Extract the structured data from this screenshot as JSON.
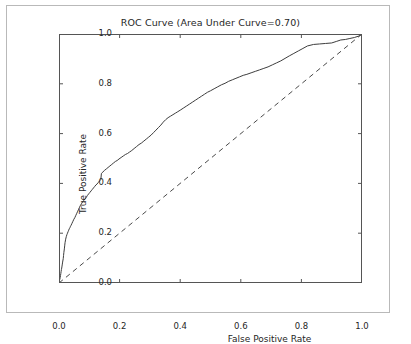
{
  "figure": {
    "background_color": "#ffffff",
    "frame_color": "#b9b9b9",
    "axis_color": "#555555",
    "curve_color": "#3d3d3d",
    "chance_line_color": "#4a4a4a",
    "text_color": "#262626"
  },
  "chart_data": {
    "type": "line",
    "title": "ROC Curve (Area Under Curve=0.70)",
    "xlabel": "False Positive Rate",
    "ylabel": "True Positive Rate",
    "xlim": [
      0.0,
      1.0
    ],
    "ylim": [
      0.0,
      1.0
    ],
    "grid": false,
    "legend": "none",
    "auc": 0.7,
    "xticks": [
      "0.0",
      "0.2",
      "0.4",
      "0.6",
      "0.8",
      "1.0"
    ],
    "xtick_values": [
      0.0,
      0.2,
      0.4,
      0.6,
      0.8,
      1.0
    ],
    "yticks": [
      "0.0",
      "0.2",
      "0.4",
      "0.6",
      "0.8",
      "1.0"
    ],
    "ytick_values": [
      0.0,
      0.2,
      0.4,
      0.6,
      0.8,
      1.0
    ],
    "series": [
      {
        "name": "ROC curve",
        "style": "solid",
        "x": [
          0.0,
          0.002,
          0.004,
          0.005,
          0.006,
          0.007,
          0.008,
          0.009,
          0.01,
          0.011,
          0.012,
          0.014,
          0.015,
          0.016,
          0.018,
          0.019,
          0.02,
          0.022,
          0.024,
          0.026,
          0.028,
          0.03,
          0.032,
          0.034,
          0.036,
          0.038,
          0.04,
          0.043,
          0.046,
          0.049,
          0.052,
          0.055,
          0.058,
          0.061,
          0.064,
          0.067,
          0.07,
          0.074,
          0.078,
          0.082,
          0.086,
          0.09,
          0.094,
          0.098,
          0.102,
          0.106,
          0.11,
          0.114,
          0.118,
          0.122,
          0.126,
          0.13,
          0.134,
          0.136,
          0.138,
          0.14,
          0.145,
          0.15,
          0.156,
          0.162,
          0.168,
          0.174,
          0.18,
          0.186,
          0.192,
          0.198,
          0.205,
          0.212,
          0.219,
          0.226,
          0.233,
          0.24,
          0.248,
          0.256,
          0.264,
          0.272,
          0.28,
          0.288,
          0.296,
          0.304,
          0.312,
          0.32,
          0.328,
          0.336,
          0.344,
          0.352,
          0.36,
          0.368,
          0.376,
          0.384,
          0.392,
          0.4,
          0.41,
          0.42,
          0.43,
          0.44,
          0.45,
          0.46,
          0.47,
          0.48,
          0.49,
          0.5,
          0.512,
          0.524,
          0.536,
          0.548,
          0.56,
          0.572,
          0.584,
          0.596,
          0.608,
          0.62,
          0.634,
          0.648,
          0.662,
          0.676,
          0.69,
          0.704,
          0.718,
          0.732,
          0.746,
          0.76,
          0.775,
          0.79,
          0.805,
          0.82,
          0.84,
          0.86,
          0.88,
          0.9,
          0.915,
          0.93,
          0.945,
          0.96,
          0.975,
          0.99,
          1.0
        ],
        "y": [
          0.0,
          0.012,
          0.022,
          0.03,
          0.038,
          0.046,
          0.054,
          0.06,
          0.068,
          0.076,
          0.084,
          0.098,
          0.11,
          0.122,
          0.14,
          0.152,
          0.162,
          0.176,
          0.186,
          0.194,
          0.2,
          0.206,
          0.212,
          0.218,
          0.222,
          0.228,
          0.232,
          0.24,
          0.248,
          0.256,
          0.262,
          0.27,
          0.278,
          0.286,
          0.294,
          0.302,
          0.31,
          0.318,
          0.326,
          0.332,
          0.338,
          0.344,
          0.352,
          0.358,
          0.364,
          0.37,
          0.376,
          0.382,
          0.388,
          0.394,
          0.398,
          0.404,
          0.41,
          0.412,
          0.415,
          0.44,
          0.446,
          0.452,
          0.458,
          0.464,
          0.47,
          0.476,
          0.482,
          0.488,
          0.492,
          0.498,
          0.504,
          0.51,
          0.516,
          0.52,
          0.526,
          0.532,
          0.54,
          0.548,
          0.556,
          0.562,
          0.57,
          0.578,
          0.586,
          0.594,
          0.604,
          0.614,
          0.624,
          0.634,
          0.646,
          0.656,
          0.664,
          0.67,
          0.676,
          0.682,
          0.688,
          0.694,
          0.702,
          0.71,
          0.718,
          0.726,
          0.734,
          0.742,
          0.75,
          0.758,
          0.766,
          0.772,
          0.78,
          0.788,
          0.796,
          0.802,
          0.81,
          0.816,
          0.822,
          0.828,
          0.834,
          0.838,
          0.844,
          0.85,
          0.856,
          0.862,
          0.868,
          0.876,
          0.884,
          0.892,
          0.902,
          0.912,
          0.922,
          0.932,
          0.942,
          0.952,
          0.958,
          0.96,
          0.962,
          0.964,
          0.97,
          0.976,
          0.978,
          0.982,
          0.986,
          0.992,
          1.0
        ]
      },
      {
        "name": "chance line",
        "style": "dashed",
        "x": [
          0.0,
          1.0
        ],
        "y": [
          0.0,
          1.0
        ]
      }
    ]
  }
}
